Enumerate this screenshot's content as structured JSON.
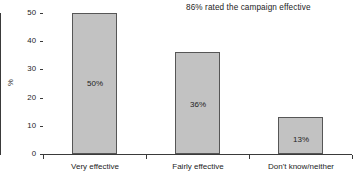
{
  "chart_data": {
    "type": "bar",
    "title": "",
    "subtitle": "",
    "annotation": "86% rated the campaign effective",
    "xlabel": "",
    "ylabel": "%",
    "categories": [
      "Very effective",
      "Fairly effective",
      "Don't know/neither"
    ],
    "values": [
      50,
      36,
      13
    ],
    "data_labels": [
      "50%",
      "36%",
      "13%"
    ],
    "ylim": [
      0,
      50
    ],
    "ytick_values": [
      0,
      10,
      20,
      30,
      40,
      50
    ],
    "ytick_labels": [
      "0",
      "10",
      "20",
      "30",
      "40",
      "50"
    ],
    "grid": false,
    "legend": "none",
    "bar_fill_color": "#c2c2c2",
    "bar_border_color": "#565656",
    "axis_color": "#3a3a3a",
    "background_color": "#ffffff"
  }
}
